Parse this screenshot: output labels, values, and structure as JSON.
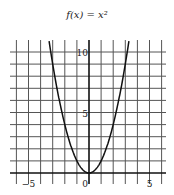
{
  "title": "f(x) = x²",
  "chart_data": {
    "type": "line",
    "title": "f(x) = x²",
    "xlabel": "",
    "ylabel": "",
    "xlim": [
      -6,
      6
    ],
    "ylim": [
      -1,
      11
    ],
    "grid": true,
    "x_ticks": [
      -5,
      0,
      5
    ],
    "y_ticks": [
      5,
      10
    ],
    "series": [
      {
        "name": "f(x) = x^2",
        "x": [
          -3.3,
          -3,
          -2.5,
          -2,
          -1.5,
          -1,
          -0.5,
          0,
          0.5,
          1,
          1.5,
          2,
          2.5,
          3,
          3.3
        ],
        "y": [
          10.89,
          9,
          6.25,
          4,
          2.25,
          1,
          0.25,
          0,
          0.25,
          1,
          2.25,
          4,
          6.25,
          9,
          10.89
        ]
      }
    ],
    "colors": {
      "grid": "#555555",
      "axis": "#111111",
      "curve": "#111111"
    }
  }
}
